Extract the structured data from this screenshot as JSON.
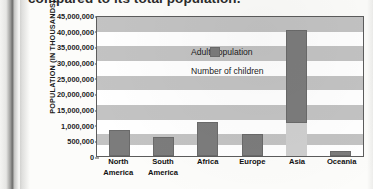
{
  "caption": "compared to its total population.",
  "chart_data": {
    "type": "bar",
    "title": "",
    "xlabel": "",
    "ylabel": "POPULATION (IN THOUSANDS)",
    "categories": [
      "North America",
      "South America",
      "Africa",
      "Europe",
      "Asia",
      "Oceania"
    ],
    "category_lines": [
      [
        "North",
        "America"
      ],
      [
        "South",
        "America"
      ],
      [
        "Africa",
        ""
      ],
      [
        "Europe",
        ""
      ],
      [
        "Asia",
        ""
      ],
      [
        "Oceania",
        ""
      ]
    ],
    "ytick_labels": [
      "45,000,000",
      "40,000,000",
      "35,000,000",
      "30,000,000",
      "25,000,000",
      "20,000,000",
      "15,000,000",
      "1,000,000",
      "500,000",
      "0"
    ],
    "ytick_values": [
      45000000,
      40000000,
      35000000,
      30000000,
      25000000,
      20000000,
      15000000,
      1000000,
      500000,
      0
    ],
    "grid": "alternating-horizontal-bands",
    "legend_position": "inside-top-left",
    "series": [
      {
        "name": "Adult population",
        "color": "#7c7c7c",
        "values": [
          550000,
          400000,
          1800000,
          700000,
          43500000,
          30000
        ]
      },
      {
        "name": "Number of children",
        "color": "#cfcfcf",
        "values": [
          0,
          0,
          0,
          0,
          13000000,
          250000
        ]
      }
    ],
    "plot_fractions": {
      "adult_top": [
        0.815,
        0.862,
        0.752,
        0.843,
        0.096,
        0.962
      ],
      "adult_bottom": [
        1.0,
        1.0,
        1.0,
        1.0,
        0.765,
        1.0
      ],
      "kid_top": [
        1.0,
        1.0,
        1.0,
        1.0,
        0.765,
        0.962
      ]
    },
    "band_rows": [
      {
        "top": 0.0,
        "height": 0.108,
        "shaded": true
      },
      {
        "top": 0.108,
        "height": 0.104,
        "shaded": false
      },
      {
        "top": 0.212,
        "height": 0.106,
        "shaded": true
      },
      {
        "top": 0.318,
        "height": 0.104,
        "shaded": false
      },
      {
        "top": 0.422,
        "height": 0.106,
        "shaded": true
      },
      {
        "top": 0.528,
        "height": 0.104,
        "shaded": false
      },
      {
        "top": 0.632,
        "height": 0.106,
        "shaded": true
      },
      {
        "top": 0.738,
        "height": 0.104,
        "shaded": false
      },
      {
        "top": 0.842,
        "height": 0.08,
        "shaded": true
      },
      {
        "top": 0.922,
        "height": 0.078,
        "shaded": false
      }
    ]
  }
}
